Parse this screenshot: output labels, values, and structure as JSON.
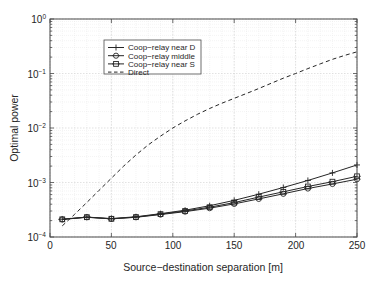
{
  "chart_data": {
    "type": "line",
    "title": "",
    "xlabel": "Source−destination separation [m]",
    "ylabel": "Optimal power",
    "xlim": [
      0,
      250
    ],
    "ylim": [
      0.0001,
      1
    ],
    "yscale": "log",
    "xscale": "linear",
    "grid": true,
    "grid_minor": true,
    "legend_position": "upper left",
    "xticks": [
      0,
      50,
      100,
      150,
      200,
      250
    ],
    "xticklabels": [
      "0",
      "50",
      "100",
      "150",
      "200",
      "250"
    ],
    "yticks": [
      1,
      0.1,
      0.01,
      0.001,
      0.0001
    ],
    "yticklabels": [
      "10^0",
      "10^-1",
      "10^-2",
      "10^-3",
      "10^-4"
    ],
    "series": [
      {
        "name": "Coop-relay near D",
        "marker": "plus",
        "linestyle": "solid",
        "color": "#262626",
        "x": [
          10,
          30,
          50,
          70,
          90,
          110,
          130,
          150,
          170,
          190,
          210,
          230,
          250
        ],
        "y": [
          0.000212,
          0.000232,
          0.000218,
          0.000235,
          0.000268,
          0.00031,
          0.000375,
          0.00047,
          0.00061,
          0.00081,
          0.00109,
          0.0015,
          0.0021
        ]
      },
      {
        "name": "Coop-relay middle",
        "marker": "circle",
        "linestyle": "solid",
        "color": "#262626",
        "x": [
          10,
          30,
          50,
          70,
          90,
          110,
          130,
          150,
          170,
          190,
          210,
          230,
          250
        ],
        "y": [
          0.00021,
          0.00023,
          0.000215,
          0.00023,
          0.000258,
          0.000292,
          0.000338,
          0.000405,
          0.0005,
          0.00062,
          0.000775,
          0.00094,
          0.00115
        ]
      },
      {
        "name": "Coop-relay near S",
        "marker": "square",
        "linestyle": "solid",
        "color": "#262626",
        "x": [
          10,
          30,
          50,
          70,
          90,
          110,
          130,
          150,
          170,
          190,
          210,
          230,
          250
        ],
        "y": [
          0.000211,
          0.000231,
          0.000216,
          0.000232,
          0.000263,
          0.0003,
          0.000352,
          0.000428,
          0.00054,
          0.000675,
          0.000845,
          0.001035,
          0.0013
        ]
      },
      {
        "name": "Direct",
        "marker": "none",
        "linestyle": "dashed",
        "color": "#262626",
        "x": [
          10,
          20,
          30,
          40,
          50,
          60,
          70,
          80,
          90,
          100,
          110,
          120,
          130,
          140,
          150,
          160,
          170,
          180,
          190,
          200,
          210,
          220,
          230,
          240,
          250
        ],
        "y": [
          0.00016,
          0.00026,
          0.00043,
          0.00072,
          0.0012,
          0.002,
          0.0032,
          0.0049,
          0.0071,
          0.01,
          0.0135,
          0.0178,
          0.0228,
          0.0285,
          0.035,
          0.043,
          0.053,
          0.066,
          0.082,
          0.1,
          0.123,
          0.15,
          0.182,
          0.215,
          0.25
        ]
      }
    ]
  },
  "axes": {
    "ylabel": "Optimal power",
    "xlabel": "Source−destination separation [m]",
    "xtick_0": "0",
    "xtick_1": "50",
    "xtick_2": "100",
    "xtick_3": "150",
    "xtick_4": "200",
    "xtick_5": "250",
    "ytick_0_base": "10",
    "ytick_0_exp": "0",
    "ytick_1_base": "10",
    "ytick_1_exp": "−1",
    "ytick_2_base": "10",
    "ytick_2_exp": "−2",
    "ytick_3_base": "10",
    "ytick_3_exp": "−3",
    "ytick_4_base": "10",
    "ytick_4_exp": "−4"
  },
  "legend": {
    "items": [
      {
        "label": "Coop−relay near D",
        "marker": "plus",
        "style": "solid"
      },
      {
        "label": "Coop−relay middle",
        "marker": "circle",
        "style": "solid"
      },
      {
        "label": "Coop−relay near S",
        "marker": "square",
        "style": "solid"
      },
      {
        "label": "Direct",
        "marker": "none",
        "style": "dashed"
      }
    ]
  },
  "colors": {
    "line": "#262626",
    "grid_major": "#cfcfcf",
    "grid_minor": "#e6e6e6",
    "frame": "#4a4a4a",
    "background": "#ffffff"
  }
}
